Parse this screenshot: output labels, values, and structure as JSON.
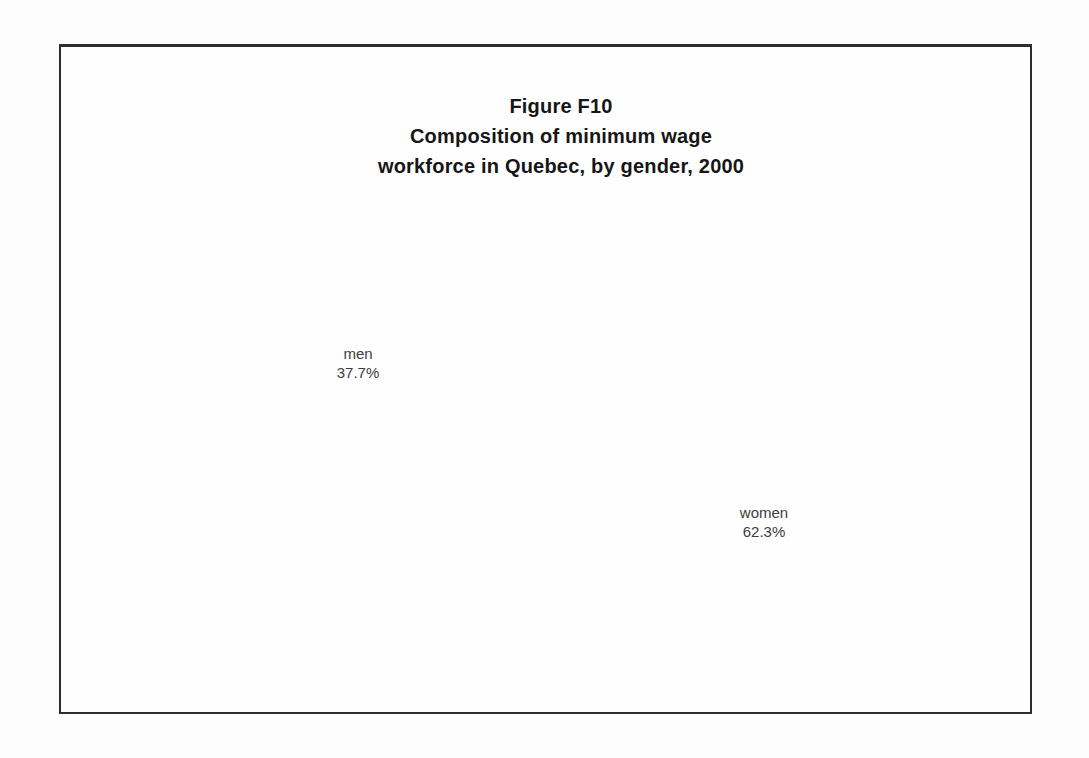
{
  "figure": {
    "title_lines": [
      "Figure F10",
      "Composition of minimum wage",
      "workforce in Quebec, by gender, 2000"
    ]
  },
  "chart_data": {
    "type": "pie",
    "style": "3d",
    "categories": [
      "women",
      "men"
    ],
    "values": [
      62.3,
      37.7
    ],
    "unit": "%",
    "start_angle_deg_from_12_oclock": 0,
    "direction": "clockwise",
    "legend_position": "none",
    "label_position": "outside",
    "slices": [
      {
        "label": "women",
        "value": 62.3,
        "display": "62.3%",
        "top_color": "#9e9e9e",
        "side_color": "#5a5a5a",
        "texture": "halftone-dots"
      },
      {
        "label": "men",
        "value": 37.7,
        "display": "37.7%",
        "top_color": "#f1f1ef",
        "side_color": "#9a9a9a",
        "texture": "crosshatch-side"
      }
    ],
    "outline_color": "#3c3c3c"
  }
}
